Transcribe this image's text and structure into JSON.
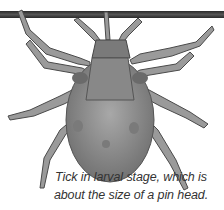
{
  "image": {
    "subject": "tick-larva-illustration",
    "bar_color": "#333333",
    "body_color": "#8a8a8a"
  },
  "caption": {
    "line1": "Tick in larval stage, which is",
    "line2": "about the size of a pin head."
  }
}
